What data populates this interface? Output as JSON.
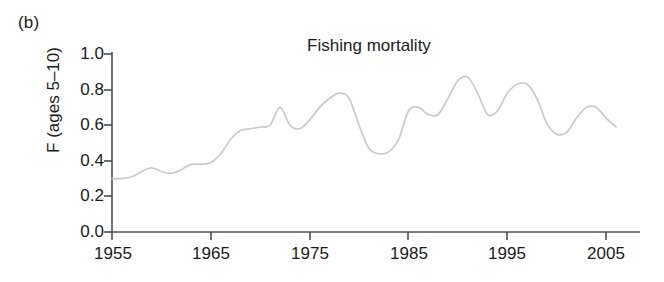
{
  "panel": {
    "label": "(b)"
  },
  "chart_data": {
    "type": "line",
    "title": "Fishing mortality",
    "xlabel": "",
    "ylabel": "F (ages 5–10)",
    "xlim": [
      1955,
      2006
    ],
    "ylim": [
      0.0,
      1.0
    ],
    "grid": false,
    "legend": "none",
    "line_color": "#c9c9c9",
    "axis_color": "#4d4d4d",
    "xticks": [
      "1955",
      "1965",
      "1975",
      "1985",
      "1995",
      "2005"
    ],
    "xtick_values": [
      1955,
      1965,
      1975,
      1985,
      1995,
      2005
    ],
    "yticks": [
      "0.0",
      "0.2",
      "0.4",
      "0.6",
      "0.8",
      "1.0"
    ],
    "ytick_values": [
      0.0,
      0.2,
      0.4,
      0.6,
      0.8,
      1.0
    ],
    "series": [
      {
        "name": "F (ages 5-10)",
        "x": [
          1955,
          1956,
          1957,
          1958,
          1959,
          1960,
          1961,
          1962,
          1963,
          1964,
          1965,
          1966,
          1967,
          1968,
          1969,
          1970,
          1971,
          1972,
          1973,
          1974,
          1975,
          1976,
          1977,
          1978,
          1979,
          1980,
          1981,
          1982,
          1983,
          1984,
          1985,
          1986,
          1987,
          1988,
          1989,
          1990,
          1991,
          1992,
          1993,
          1994,
          1995,
          1996,
          1997,
          1998,
          1999,
          2000,
          2001,
          2002,
          2003,
          2004,
          2005,
          2006
        ],
        "values": [
          0.3,
          0.3,
          0.31,
          0.34,
          0.36,
          0.34,
          0.33,
          0.35,
          0.38,
          0.38,
          0.39,
          0.44,
          0.52,
          0.57,
          0.58,
          0.59,
          0.6,
          0.7,
          0.6,
          0.58,
          0.63,
          0.7,
          0.75,
          0.78,
          0.75,
          0.6,
          0.47,
          0.44,
          0.45,
          0.52,
          0.68,
          0.7,
          0.66,
          0.66,
          0.75,
          0.85,
          0.87,
          0.78,
          0.66,
          0.68,
          0.78,
          0.83,
          0.83,
          0.75,
          0.61,
          0.55,
          0.56,
          0.64,
          0.7,
          0.7,
          0.64,
          0.59
        ]
      }
    ],
    "annotations": [
      {
        "text": "(b)",
        "position": "top-left-outside"
      }
    ]
  }
}
